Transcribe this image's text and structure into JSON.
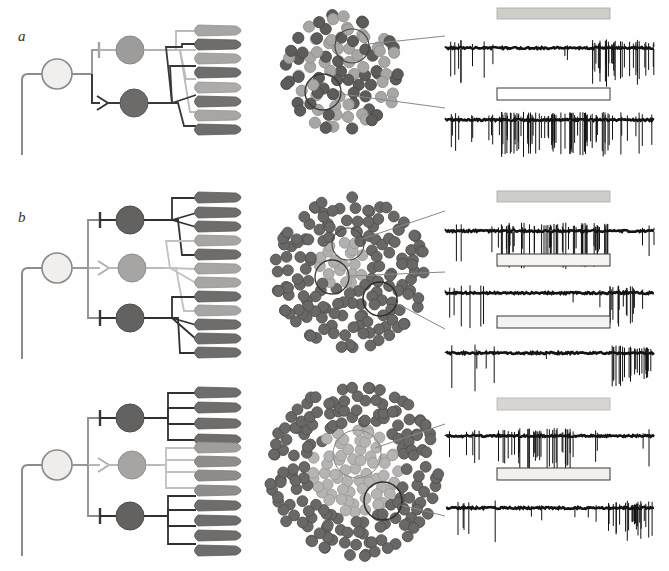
{
  "figure": {
    "background_color": "#fefefe",
    "panels": [
      {
        "id": "a",
        "label": "a",
        "label_style": "italic",
        "circuit": {
          "input_neuron": {
            "name": "afferent-input-neuron",
            "fill": "#f0efed",
            "stroke": "#8b8987",
            "radius": 15
          },
          "branches": [
            {
              "index": 0,
              "interneuron_fill": "#9e9c9a",
              "pathway_color": "#b4b2b0",
              "synapse_type": "inhibitory",
              "synapse_symbol": "t-bar",
              "target_cells": [
                0,
                2,
                4,
                6
              ]
            },
            {
              "index": 1,
              "interneuron_fill": "#6d6b69",
              "pathway_color": "#3a3836",
              "synapse_type": "excitatory",
              "synapse_symbol": "arrowhead",
              "target_cells": [
                1,
                3,
                5,
                7
              ]
            }
          ],
          "cells": {
            "count": 8,
            "shape": "teardrop",
            "fills": [
              "#a8a6a4",
              "#6f6d6b",
              "#a8a6a4",
              "#6f6d6b",
              "#aeacaa",
              "#74726f",
              "#a8a6a4",
              "#6f6d6b"
            ]
          }
        },
        "cluster": {
          "name": "cell-population-map-a",
          "description": "Mixed light and dark somata, evenly intermingled",
          "dot_colors": [
            "#a9a7a5",
            "#5e5c5a"
          ],
          "dot_count": 78,
          "recording_sites": 2,
          "site_labels": [
            "upper-recording-site",
            "lower-recording-site"
          ]
        },
        "traces": [
          {
            "index": 0,
            "name": "trace-suppressed",
            "stimulus_bar": {
              "fill": "#cfcdca",
              "style": "filled",
              "label": "stimulus-bar-filled"
            },
            "response": "suppression-during-stimulus-then-rebound-burst",
            "baseline_rate": "moderate",
            "stimulus_rate": "silent",
            "post_rate": "high-burst"
          },
          {
            "index": 1,
            "name": "trace-excited",
            "stimulus_bar": {
              "fill": "#ffffff",
              "style": "open",
              "label": "stimulus-bar-open"
            },
            "response": "strong-increase-during-stimulus",
            "baseline_rate": "moderate",
            "stimulus_rate": "very-high",
            "post_rate": "moderate"
          }
        ]
      },
      {
        "id": "b",
        "label": "b",
        "label_style": "italic",
        "circuit": {
          "input_neuron": {
            "name": "afferent-input-neuron",
            "fill": "#f0efed",
            "stroke": "#8b8987",
            "radius": 15
          },
          "branches": [
            {
              "index": 0,
              "interneuron_fill": "#646260",
              "pathway_color": "#333130",
              "synapse_type": "inhibitory",
              "synapse_symbol": "t-bar",
              "target_cells": [
                0,
                1,
                2,
                4
              ]
            },
            {
              "index": 1,
              "interneuron_fill": "#a7a5a3",
              "pathway_color": "#bcbab8",
              "synapse_type": "excitatory",
              "synapse_symbol": "arrowhead",
              "target_cells": [
                3,
                5,
                6,
                9
              ]
            },
            {
              "index": 2,
              "interneuron_fill": "#646260",
              "pathway_color": "#333130",
              "synapse_type": "inhibitory",
              "synapse_symbol": "t-bar",
              "target_cells": [
                7,
                8,
                10,
                11
              ]
            }
          ],
          "cells": {
            "count": 12,
            "shape": "teardrop",
            "fills": [
              "#6f6d6b",
              "#6f6d6b",
              "#6f6d6b",
              "#a8a6a4",
              "#6f6d6b",
              "#a8a6a4",
              "#a8a6a4",
              "#6f6d6b",
              "#a8a6a4",
              "#6f6d6b",
              "#6f6d6b",
              "#6f6d6b"
            ]
          }
        },
        "cluster": {
          "name": "cell-population-map-b",
          "description": "Dark somata surround a small light-cell patch near centre",
          "dot_colors": [
            "#6a6866",
            "#b2b0ae"
          ],
          "dot_count": 140,
          "recording_sites": 3,
          "site_labels": [
            "upper-recording-site",
            "middle-recording-site",
            "lower-recording-site"
          ]
        },
        "traces": [
          {
            "index": 0,
            "name": "trace-excited",
            "stimulus_bar": {
              "fill": "#cfcdca",
              "style": "filled",
              "label": "stimulus-bar-filled"
            },
            "response": "strong-increase-during-stimulus",
            "baseline_rate": "low",
            "stimulus_rate": "very-high",
            "post_rate": "low"
          },
          {
            "index": 1,
            "name": "trace-suppressed",
            "stimulus_bar": {
              "fill": "#f4f3f1",
              "style": "open",
              "label": "stimulus-bar-open"
            },
            "response": "suppression-during-stimulus-then-offset-burst",
            "baseline_rate": "moderate",
            "stimulus_rate": "silent",
            "post_rate": "burst"
          },
          {
            "index": 2,
            "name": "trace-offset-burst",
            "stimulus_bar": {
              "fill": "#f4f3f1",
              "style": "open",
              "label": "stimulus-bar-open"
            },
            "response": "silent-during-stimulus-then-sustained-offset-burst",
            "baseline_rate": "low",
            "stimulus_rate": "silent",
            "post_rate": "high-sustained"
          }
        ]
      },
      {
        "id": "c",
        "label": "",
        "label_style": "italic",
        "circuit": {
          "input_neuron": {
            "name": "afferent-input-neuron",
            "fill": "#eeedeb",
            "stroke": "#8b8987",
            "radius": 15
          },
          "branches": [
            {
              "index": 0,
              "interneuron_fill": "#646260",
              "pathway_color": "#333130",
              "synapse_type": "inhibitory",
              "synapse_symbol": "t-bar",
              "target_cells": [
                0,
                1,
                2,
                3
              ]
            },
            {
              "index": 1,
              "interneuron_fill": "#a7a5a3",
              "pathway_color": "#bcbab8",
              "synapse_type": "excitatory",
              "synapse_symbol": "arrowhead",
              "target_cells": [
                4,
                5,
                6,
                7
              ]
            },
            {
              "index": 2,
              "interneuron_fill": "#646260",
              "pathway_color": "#333130",
              "synapse_type": "inhibitory",
              "synapse_symbol": "t-bar",
              "target_cells": [
                8,
                9,
                10,
                11
              ]
            }
          ],
          "cells": {
            "count": 12,
            "shape": "teardrop",
            "fills": [
              "#6f6d6b",
              "#6f6d6b",
              "#6f6d6b",
              "#6f6d6b",
              "#a09e9c",
              "#8f8d8b",
              "#8f8d8b",
              "#8f8d8b",
              "#6f6d6b",
              "#6f6d6b",
              "#6f6d6b",
              "#6f6d6b"
            ]
          }
        },
        "cluster": {
          "name": "cell-population-map-c",
          "description": "Large dark annulus enclosing a broad light-cell core",
          "dot_colors": [
            "#6a6866",
            "#b6b4b2"
          ],
          "dot_count": 190,
          "recording_sites": 2,
          "site_labels": [
            "core-recording-site",
            "surround-recording-site"
          ]
        },
        "traces": [
          {
            "index": 0,
            "name": "trace-excited",
            "stimulus_bar": {
              "fill": "#d8d6d3",
              "style": "filled",
              "label": "stimulus-bar-filled"
            },
            "response": "increase-during-stimulus",
            "baseline_rate": "low",
            "stimulus_rate": "high",
            "post_rate": "low"
          },
          {
            "index": 1,
            "name": "trace-offset-burst",
            "stimulus_bar": {
              "fill": "#f1f0ee",
              "style": "open",
              "label": "stimulus-bar-open"
            },
            "response": "silent-during-stimulus-then-offset-burst",
            "baseline_rate": "low",
            "stimulus_rate": "silent",
            "post_rate": "high-burst"
          }
        ]
      }
    ],
    "legend": {
      "inhibitory_symbol": "t-bar",
      "excitatory_symbol": "arrowhead",
      "light_cell_meaning": "weakly-active population",
      "dark_cell_meaning": "strongly-active population"
    }
  }
}
